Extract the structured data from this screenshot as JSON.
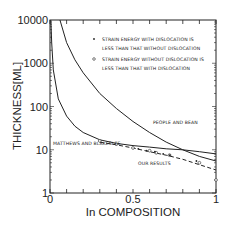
{
  "chart_data": {
    "type": "line",
    "title": "",
    "xlabel": "In COMPOSITION",
    "ylabel": "THICKNESS[ML]",
    "xlim": [
      0,
      1
    ],
    "ylim": [
      1,
      10000
    ],
    "yscale": "log",
    "grid": false,
    "x_ticks": [
      "0",
      "0.5",
      "1"
    ],
    "y_ticks": [
      "1",
      "10",
      "100",
      "1000",
      "10000"
    ],
    "legend": {
      "position": "upper right",
      "entries": [
        {
          "marker": "filled-dot",
          "line1": "STRAIN ENERGY WITH DISLOCATION IS",
          "line2": "LESS THAN THAT WITHOUT DISLOCATION"
        },
        {
          "marker": "open-circle",
          "line1": "STRAIN ENERGY WITHOUT DISLOCATION IS",
          "line2": "LESS THAN THAT WITH DISLOCATION"
        }
      ]
    },
    "series": [
      {
        "name": "PEOPLE AND BEAN",
        "style": "solid",
        "x": [
          0.06,
          0.1,
          0.15,
          0.2,
          0.3,
          0.4,
          0.5,
          0.6,
          0.7,
          0.8,
          0.9,
          1.0
        ],
        "y": [
          10000,
          3000,
          1200,
          600,
          200,
          90,
          45,
          25,
          15,
          10,
          7,
          5.5
        ]
      },
      {
        "name": "MATTHEWS AND BLAKESLEE",
        "style": "solid",
        "x": [
          0.005,
          0.01,
          0.02,
          0.05,
          0.1,
          0.15,
          0.2,
          0.3,
          0.4,
          0.5,
          0.6,
          0.7,
          0.8,
          0.9,
          1.0
        ],
        "y": [
          10000,
          3000,
          700,
          150,
          60,
          35,
          25,
          17,
          14,
          12.5,
          11.5,
          10.5,
          10,
          9,
          8
        ]
      },
      {
        "name": "OUR RESULTS",
        "style": "dashed",
        "x": [
          0.3,
          0.4,
          0.5,
          0.6,
          0.7,
          0.8,
          0.9,
          1.0
        ],
        "y": [
          15,
          13,
          11,
          9,
          7.5,
          6,
          4.5,
          3.4
        ]
      }
    ],
    "points": {
      "open": {
        "x": [
          0.3,
          0.4,
          0.5,
          0.6,
          0.64,
          0.72,
          0.9,
          1.0
        ],
        "y": [
          16,
          13.5,
          11,
          9.5,
          8.5,
          7.5,
          5,
          2
        ]
      },
      "filled": {
        "x": [
          0.55,
          0.6,
          0.65,
          0.7,
          0.74,
          0.9
        ],
        "y": [
          10.5,
          9.5,
          9,
          8,
          7.5,
          5.5
        ]
      }
    },
    "annotations": [
      "PEOPLE AND BEAN",
      "MATTHEWS AND BLAKESLEE",
      "OUR RESULTS"
    ]
  }
}
